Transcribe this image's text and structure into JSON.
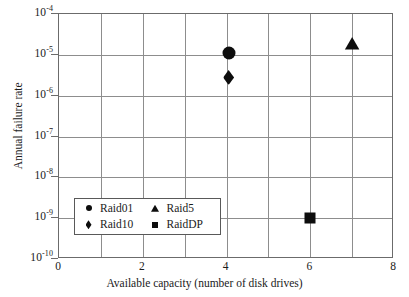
{
  "chart_data": {
    "type": "scatter",
    "title": "",
    "xlabel": "Available capacity (number of disk drives)",
    "ylabel": "Annual failure rate",
    "xlim": [
      0,
      8
    ],
    "ylim": [
      1e-10,
      0.0001
    ],
    "yscale": "log",
    "xscale": "linear",
    "grid": true,
    "x_ticks": [
      0,
      2,
      4,
      6,
      8
    ],
    "x_tick_labels": [
      "0",
      "2",
      "4",
      "6",
      "8"
    ],
    "x_gridline_step": 1,
    "y_ticks": [
      0.0001,
      1e-05,
      1e-06,
      1e-07,
      1e-08,
      1e-09,
      1e-10
    ],
    "y_tick_labels": [
      {
        "mantissa": "10",
        "exponent": "-4"
      },
      {
        "mantissa": "10",
        "exponent": "-5"
      },
      {
        "mantissa": "10",
        "exponent": "-6"
      },
      {
        "mantissa": "10",
        "exponent": "-7"
      },
      {
        "mantissa": "10",
        "exponent": "-8"
      },
      {
        "mantissa": "10",
        "exponent": "-9"
      },
      {
        "mantissa": "10",
        "exponent": "-10"
      }
    ],
    "legend_position": "lower left",
    "marker_color": "#0d0d0d",
    "series": [
      {
        "name": "Raid01",
        "marker": "circle",
        "x": [
          4.05
        ],
        "y": [
          1.1e-05
        ]
      },
      {
        "name": "Raid10",
        "marker": "diamond",
        "x": [
          4.05
        ],
        "y": [
          2.8e-06
        ]
      },
      {
        "name": "Raid5",
        "marker": "triangle",
        "x": [
          7.0
        ],
        "y": [
          1.9e-05
        ]
      },
      {
        "name": "RaidDP",
        "marker": "square",
        "x": [
          6.0
        ],
        "y": [
          1e-09
        ]
      }
    ]
  },
  "legend": {
    "entries": [
      {
        "label": "Raid01",
        "marker": "circle"
      },
      {
        "label": "Raid10",
        "marker": "diamond"
      },
      {
        "label": "Raid5",
        "marker": "triangle"
      },
      {
        "label": "RaidDP",
        "marker": "square"
      }
    ]
  }
}
